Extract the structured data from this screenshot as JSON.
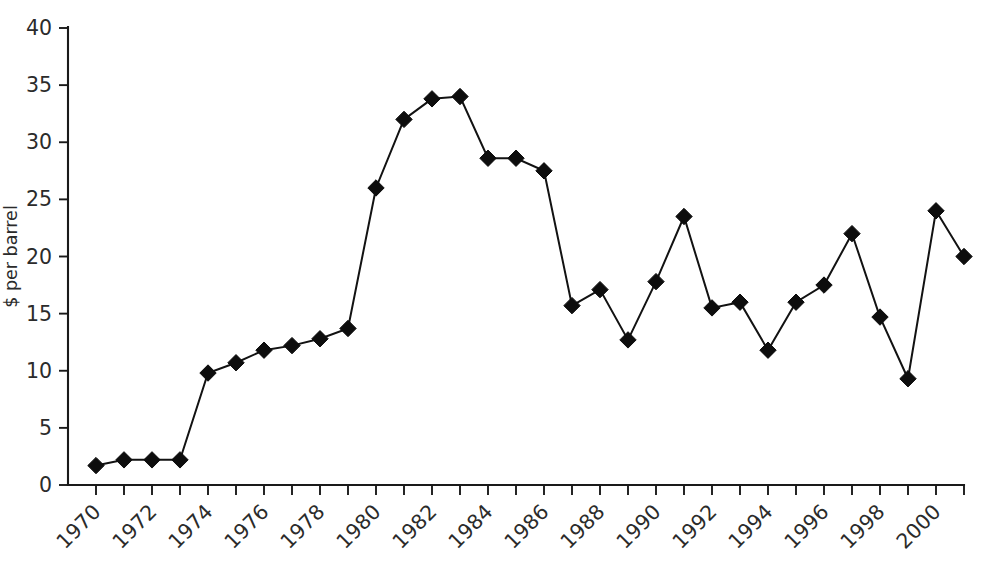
{
  "chart_data": {
    "type": "line",
    "title": "",
    "subtitle": "",
    "xlabel": "",
    "ylabel": "$ per barrel",
    "grid": false,
    "legend": "none",
    "marker": "filled-diamond",
    "line_color": "#121212",
    "marker_color": "#0d0d0d",
    "background_color": "#ffffff",
    "xlim": [
      1969.3,
      2001.7
    ],
    "ylim": [
      0,
      40
    ],
    "y_ticks": [
      0,
      5,
      10,
      15,
      20,
      25,
      30,
      35,
      40
    ],
    "y_tick_labels": [
      "0",
      "5",
      "10",
      "15",
      "20",
      "25",
      "30",
      "35",
      "40"
    ],
    "x_ticks": [
      1970,
      1971,
      1972,
      1973,
      1974,
      1975,
      1976,
      1977,
      1978,
      1979,
      1980,
      1981,
      1982,
      1983,
      1984,
      1985,
      1986,
      1987,
      1988,
      1989,
      1990,
      1991,
      1992,
      1993,
      1994,
      1995,
      1996,
      1997,
      1998,
      1999,
      2000,
      2001
    ],
    "x_tick_labels_shown": [
      "1970",
      "1972",
      "1974",
      "1976",
      "1978",
      "1980",
      "1982",
      "1984",
      "1986",
      "1988",
      "1990",
      "1992",
      "1994",
      "1996",
      "1998",
      "2000"
    ],
    "x_tick_label_rotation": -45,
    "x": [
      1970,
      1971,
      1972,
      1973,
      1974,
      1975,
      1976,
      1977,
      1978,
      1979,
      1980,
      1981,
      1982,
      1983,
      1984,
      1985,
      1986,
      1987,
      1988,
      1989,
      1990,
      1991,
      1992,
      1993,
      1994,
      1995,
      1996,
      1997,
      1998,
      1999,
      2000,
      2001
    ],
    "values": [
      1.7,
      2.2,
      2.2,
      2.2,
      9.8,
      10.7,
      11.8,
      12.2,
      12.8,
      13.7,
      26.0,
      32.0,
      33.8,
      34.0,
      28.6,
      28.6,
      27.5,
      15.7,
      17.1,
      12.7,
      17.8,
      23.5,
      15.5,
      16.0,
      11.8,
      16.0,
      17.5,
      22.0,
      14.7,
      9.3,
      24.0,
      20.0
    ]
  }
}
